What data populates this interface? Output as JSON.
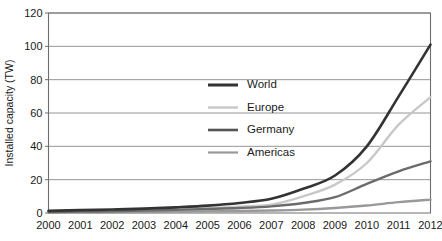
{
  "chart_data": {
    "type": "line",
    "title": "",
    "subtitle": "",
    "xlabel": "",
    "ylabel": "Installed capacity (TW)",
    "x": [
      2000,
      2001,
      2002,
      2003,
      2004,
      2005,
      2006,
      2007,
      2008,
      2009,
      2010,
      2011,
      2012
    ],
    "categories": [
      "2000",
      "2001",
      "2002",
      "2003",
      "2004",
      "2005",
      "2006",
      "2007",
      "2008",
      "2009",
      "2010",
      "2011",
      "2012"
    ],
    "xlim": [
      2000,
      2012
    ],
    "ylim": [
      0,
      120
    ],
    "y_ticks": [
      0,
      20,
      40,
      60,
      80,
      100,
      120
    ],
    "y_tick_labels": [
      "0",
      "20",
      "40",
      "60",
      "80",
      "100",
      "120"
    ],
    "grid": true,
    "grid_axis": "y",
    "legend_position": "inside-center",
    "series": [
      {
        "name": "World",
        "color": "#333333",
        "width": 2.6,
        "values": [
          1.3,
          1.7,
          2.1,
          2.6,
          3.4,
          4.4,
          6.0,
          8.5,
          14.5,
          22.5,
          40.0,
          70.0,
          101.0
        ]
      },
      {
        "name": "Europe",
        "color": "#c8c8c8",
        "width": 2.4,
        "values": [
          0.8,
          1.0,
          1.3,
          1.7,
          2.3,
          3.0,
          3.8,
          5.0,
          10.0,
          17.0,
          30.0,
          53.0,
          69.5
        ]
      },
      {
        "name": "Germany",
        "color": "#6b6b6b",
        "width": 2.4,
        "values": [
          0.6,
          0.8,
          1.0,
          1.4,
          1.9,
          2.4,
          3.0,
          4.0,
          6.0,
          9.5,
          17.5,
          25.0,
          31.0
        ]
      },
      {
        "name": "Americas",
        "color": "#999999",
        "width": 2.4,
        "values": [
          0.3,
          0.4,
          0.5,
          0.6,
          0.8,
          1.0,
          1.2,
          1.5,
          2.0,
          3.0,
          4.5,
          6.5,
          8.0
        ]
      }
    ],
    "legend_entries": [
      {
        "label": "World",
        "color": "#333333",
        "width": 3.0
      },
      {
        "label": "Europe",
        "color": "#c8c8c8",
        "width": 2.4
      },
      {
        "label": "Germany",
        "color": "#555555",
        "width": 2.6
      },
      {
        "label": "Americas",
        "color": "#999999",
        "width": 2.2
      }
    ],
    "colors": {
      "gridline": "#8a8a8a",
      "axis": "#6e6e6e",
      "text": "#1a1a1a",
      "background": "#ffffff"
    }
  }
}
